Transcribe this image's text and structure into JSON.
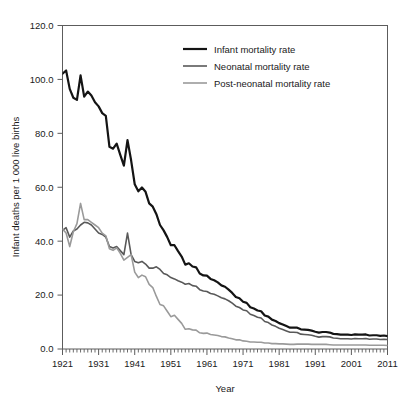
{
  "chart_data": {
    "type": "line",
    "title": "",
    "xlabel": "Year",
    "ylabel": "Infant deaths per 1 000 live births",
    "xlim": [
      1921,
      2011
    ],
    "ylim": [
      0,
      120
    ],
    "ytick_labels": [
      "120.0",
      "100.0",
      "80.0",
      "60.0",
      "40.0",
      "20.0",
      "0.0"
    ],
    "ytick_values": [
      120,
      100,
      80,
      60,
      40,
      20,
      0
    ],
    "xtick_labels": [
      "1921",
      "1931",
      "1941",
      "1951",
      "1961",
      "1971",
      "1981",
      "1991",
      "2001",
      "2011"
    ],
    "xtick_values": [
      1921,
      1931,
      1941,
      1951,
      1961,
      1971,
      1981,
      1991,
      2001,
      2011
    ],
    "grid": false,
    "legend_position": "top-right-inside",
    "minor_ticks": "annual",
    "x": [
      1921,
      1922,
      1923,
      1924,
      1925,
      1926,
      1927,
      1928,
      1929,
      1930,
      1931,
      1932,
      1933,
      1934,
      1935,
      1936,
      1937,
      1938,
      1939,
      1940,
      1941,
      1942,
      1943,
      1944,
      1945,
      1946,
      1947,
      1948,
      1949,
      1950,
      1951,
      1952,
      1953,
      1954,
      1955,
      1956,
      1957,
      1958,
      1959,
      1960,
      1961,
      1962,
      1963,
      1964,
      1965,
      1966,
      1967,
      1968,
      1969,
      1970,
      1971,
      1972,
      1973,
      1974,
      1975,
      1976,
      1977,
      1978,
      1979,
      1980,
      1981,
      1982,
      1983,
      1984,
      1985,
      1986,
      1987,
      1988,
      1989,
      1990,
      1991,
      1992,
      1993,
      1994,
      1995,
      1996,
      1997,
      1998,
      1999,
      2000,
      2001,
      2002,
      2003,
      2004,
      2005,
      2006,
      2007,
      2008,
      2009,
      2010,
      2011
    ],
    "series": [
      {
        "name": "Infant mortality rate",
        "color": "#141414",
        "width": 2.2,
        "values": [
          102.1,
          103.3,
          96.5,
          93.2,
          92.4,
          101.5,
          93.6,
          95.5,
          94.0,
          91.5,
          90.0,
          87.5,
          86.5,
          75.0,
          74.3,
          76.2,
          72.0,
          68.0,
          77.5,
          70.0,
          61.1,
          58.5,
          59.9,
          58.3,
          54.0,
          52.8,
          50.0,
          46.0,
          44.0,
          41.5,
          38.5,
          38.5,
          36.3,
          34.3,
          31.3,
          31.8,
          30.6,
          30.3,
          28.0,
          27.3,
          27.2,
          26.0,
          25.5,
          24.7,
          23.6,
          23.1,
          22.0,
          20.8,
          19.3,
          18.8,
          17.5,
          17.1,
          15.5,
          15.0,
          14.3,
          14.0,
          12.4,
          12.0,
          10.9,
          10.4,
          9.6,
          9.1,
          8.5,
          7.9,
          7.9,
          7.9,
          7.3,
          7.2,
          7.1,
          6.8,
          6.4,
          6.1,
          6.3,
          6.3,
          6.1,
          5.6,
          5.5,
          5.3,
          5.3,
          5.3,
          5.2,
          5.4,
          5.3,
          5.3,
          5.4,
          5.0,
          5.1,
          5.1,
          4.9,
          5.0,
          4.8
        ]
      },
      {
        "name": "Neonatal mortality rate",
        "color": "#595959",
        "width": 1.6,
        "values": [
          44.0,
          45.0,
          41.5,
          43.8,
          44.5,
          46.0,
          47.0,
          46.8,
          46.0,
          44.5,
          43.0,
          42.5,
          41.5,
          38.0,
          37.5,
          38.0,
          36.5,
          35.0,
          43.0,
          35.0,
          32.5,
          32.0,
          32.5,
          31.5,
          30.0,
          30.0,
          30.5,
          29.5,
          28.0,
          27.5,
          26.5,
          26.0,
          25.3,
          24.8,
          24.0,
          24.3,
          23.5,
          23.3,
          22.0,
          21.5,
          21.3,
          20.6,
          20.3,
          19.7,
          19.0,
          18.6,
          17.9,
          17.0,
          15.9,
          15.4,
          14.5,
          14.2,
          12.9,
          12.4,
          11.8,
          11.5,
          10.2,
          9.8,
          8.9,
          8.4,
          7.7,
          7.2,
          6.7,
          6.2,
          6.2,
          6.1,
          5.5,
          5.4,
          5.3,
          5.1,
          4.7,
          4.4,
          4.6,
          4.6,
          4.5,
          4.1,
          4.0,
          3.8,
          3.8,
          3.8,
          3.7,
          3.9,
          3.8,
          3.8,
          3.9,
          3.6,
          3.7,
          3.7,
          3.5,
          3.6,
          3.5
        ]
      },
      {
        "name": "Post-neonatal mortality rate",
        "color": "#9a9a9a",
        "width": 1.6,
        "values": [
          44.5,
          43.0,
          38.0,
          43.5,
          46.5,
          54.0,
          48.0,
          48.0,
          47.0,
          46.0,
          45.0,
          43.0,
          42.0,
          37.2,
          36.6,
          37.5,
          35.5,
          33.0,
          34.0,
          35.0,
          28.5,
          26.5,
          27.4,
          26.8,
          24.0,
          22.8,
          19.5,
          16.5,
          16.0,
          14.0,
          12.0,
          12.5,
          11.0,
          9.5,
          7.3,
          7.5,
          7.1,
          7.0,
          6.0,
          5.8,
          5.9,
          5.4,
          5.2,
          5.0,
          4.6,
          4.5,
          4.1,
          3.8,
          3.4,
          3.4,
          3.0,
          2.9,
          2.6,
          2.6,
          2.5,
          2.5,
          2.2,
          2.2,
          2.0,
          2.0,
          1.9,
          1.9,
          1.8,
          1.7,
          1.7,
          1.8,
          1.8,
          1.8,
          1.8,
          1.7,
          1.7,
          1.7,
          1.7,
          1.7,
          1.6,
          1.5,
          1.5,
          1.5,
          1.5,
          1.5,
          1.5,
          1.5,
          1.5,
          1.5,
          1.5,
          1.4,
          1.4,
          1.4,
          1.4,
          1.4,
          1.3
        ]
      }
    ]
  },
  "legend": {
    "entries": [
      {
        "label": "Infant mortality rate"
      },
      {
        "label": "Neonatal mortality rate"
      },
      {
        "label": "Post-neonatal mortality rate"
      }
    ]
  }
}
